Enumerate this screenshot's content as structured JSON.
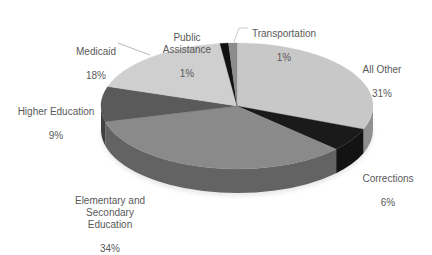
{
  "chart_data": {
    "type": "pie",
    "style": "3d",
    "title": "",
    "start_angle_deg": 0,
    "direction": "clockwise",
    "slices": [
      {
        "label": "All Other",
        "value": 31,
        "display": "31%",
        "color": "#c8c8c8"
      },
      {
        "label": "Corrections",
        "value": 6,
        "display": "6%",
        "color": "#1a1a1a"
      },
      {
        "label": "Elementary and Secondary Education",
        "value": 34,
        "display": "34%",
        "color": "#8a8a8a"
      },
      {
        "label": "Higher Education",
        "value": 9,
        "display": "9%",
        "color": "#5a5a5a"
      },
      {
        "label": "Medicaid",
        "value": 18,
        "display": "18%",
        "color": "#cfcfcf"
      },
      {
        "label": "Public Assistance",
        "value": 1,
        "display": "1%",
        "color": "#111111"
      },
      {
        "label": "Transportation",
        "value": 1,
        "display": "1%",
        "color": "#8c8c8c"
      }
    ],
    "legend": "none",
    "data_labels": "category name and percentage"
  },
  "labels": {
    "all_other": {
      "name": "All Other",
      "pct": "31%"
    },
    "corrections": {
      "name": "Corrections",
      "pct": "6%"
    },
    "elementary": {
      "name": "Elementary and\nSecondary\nEducation",
      "pct": "34%"
    },
    "higher_ed": {
      "name": "Higher Education",
      "pct": "9%"
    },
    "medicaid": {
      "name": "Medicaid",
      "pct": "18%"
    },
    "public_assistance": {
      "name": "Public\nAssistance",
      "pct": "1%"
    },
    "transportation": {
      "name": "Transportation",
      "pct": "1%"
    }
  }
}
